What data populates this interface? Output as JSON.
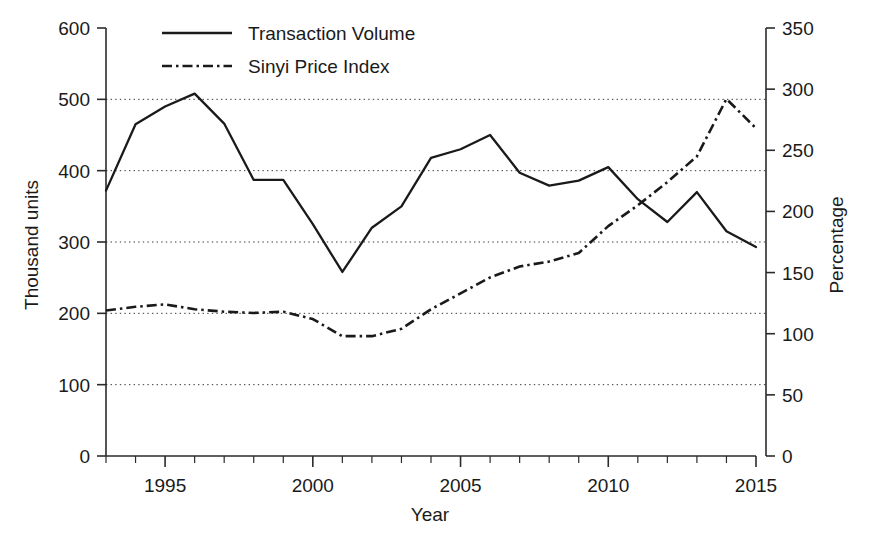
{
  "chart_data": {
    "type": "line",
    "title": "",
    "xlabel": "Year",
    "ylabel": "Thousand units",
    "y2label": "Percentage",
    "x": [
      1993,
      1994,
      1995,
      1996,
      1997,
      1998,
      1999,
      2000,
      2001,
      2002,
      2003,
      2004,
      2005,
      2006,
      2007,
      2008,
      2009,
      2010,
      2011,
      2012,
      2013,
      2014,
      2015
    ],
    "xlim": [
      1993,
      2015
    ],
    "ylim": [
      0,
      600
    ],
    "y2lim": [
      0,
      350
    ],
    "grid": true,
    "legend_position": "top-center",
    "series": [
      {
        "name": "Transaction Volume",
        "axis": "left",
        "style": "solid",
        "units": "Thousand units",
        "values": [
          372,
          465,
          490,
          508,
          466,
          387,
          387,
          325,
          258,
          320,
          350,
          418,
          430,
          450,
          397,
          379,
          386,
          405,
          360,
          328,
          370,
          315,
          293
        ]
      },
      {
        "name": "Sinyi Price Index",
        "axis": "right",
        "style": "dash-dot",
        "units": "Percentage",
        "values": [
          119,
          122,
          124,
          120,
          118,
          117,
          118,
          112,
          98,
          98,
          104,
          120,
          133,
          146,
          155,
          159,
          166,
          188,
          205,
          224,
          245,
          292,
          268
        ]
      }
    ],
    "y_ticks_left": [
      0,
      100,
      200,
      300,
      400,
      500,
      600
    ],
    "y_ticks_right": [
      0,
      50,
      100,
      150,
      200,
      250,
      300,
      350
    ],
    "x_tick_labels": [
      "1995",
      "2000",
      "2005",
      "2010",
      "2015"
    ],
    "x_tick_values": [
      1995,
      2000,
      2005,
      2010,
      2015
    ],
    "x_minor_ticks": [
      1993,
      1994,
      1995,
      1996,
      1997,
      1998,
      1999,
      2000,
      2001,
      2002,
      2003,
      2004,
      2005,
      2006,
      2007,
      2008,
      2009,
      2010,
      2011,
      2012,
      2013,
      2014,
      2015
    ],
    "colors": {
      "ink": "#1a1a1a",
      "axis": "#2b2b2b",
      "grid": "#3a3a3a",
      "background": "#ffffff"
    }
  },
  "legend": {
    "entries": [
      {
        "label": "Transaction Volume",
        "marker": "solid-line-swatch"
      },
      {
        "label": "Sinyi Price Index",
        "marker": "dash-dot-line-swatch"
      }
    ]
  }
}
